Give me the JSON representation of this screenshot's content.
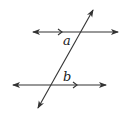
{
  "diagram": {
    "type": "parallel-lines-transversal",
    "stroke_color": "#333333",
    "lines": {
      "top": {
        "x1": 33,
        "y1": 32,
        "x2": 118,
        "y2": 32,
        "parallel_marker_x": 62
      },
      "bottom": {
        "x1": 13,
        "y1": 85,
        "x2": 106,
        "y2": 85,
        "parallel_marker_x": 77
      },
      "transversal": {
        "x1": 38,
        "y1": 108,
        "x2": 93,
        "y2": 10
      }
    },
    "labels": {
      "angle_a": "a",
      "angle_b": "b"
    }
  }
}
